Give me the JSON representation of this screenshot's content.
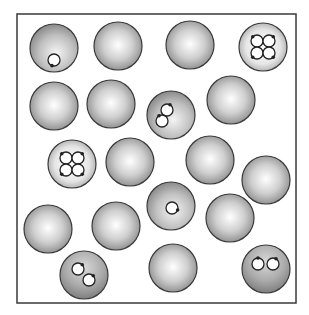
{
  "diagram": {
    "type": "particle-box",
    "frame": {
      "x": 17,
      "y": 14,
      "width": 279,
      "height": 289,
      "stroke": "#3a3a3a"
    },
    "colors": {
      "sphere_highlight": "#ffffff",
      "sphere_mid": "#c4c4c4",
      "sphere_edge": "#8a8a8a",
      "sphere_outline": "#3a3a3a",
      "loop_fill": "#ffffff",
      "loop_stroke": "#222222",
      "dot": "#222222"
    },
    "spheres": [
      {
        "id": 1,
        "cx": 54,
        "cy": 48,
        "r": 24,
        "kind": "one-loop",
        "shade": "medium"
      },
      {
        "id": 2,
        "cx": 118,
        "cy": 46,
        "r": 24,
        "kind": "plain",
        "shade": "normal"
      },
      {
        "id": 3,
        "cx": 190,
        "cy": 45,
        "r": 24,
        "kind": "plain",
        "shade": "normal"
      },
      {
        "id": 4,
        "cx": 263,
        "cy": 47,
        "r": 24,
        "kind": "four-loop",
        "shade": "light"
      },
      {
        "id": 5,
        "cx": 54,
        "cy": 106,
        "r": 24,
        "kind": "plain",
        "shade": "normal"
      },
      {
        "id": 6,
        "cx": 111,
        "cy": 104,
        "r": 24,
        "kind": "plain",
        "shade": "normal"
      },
      {
        "id": 7,
        "cx": 171,
        "cy": 115,
        "r": 24,
        "kind": "two-loop",
        "shade": "medium"
      },
      {
        "id": 8,
        "cx": 231,
        "cy": 100,
        "r": 24,
        "kind": "plain",
        "shade": "normal"
      },
      {
        "id": 9,
        "cx": 72,
        "cy": 164,
        "r": 24,
        "kind": "four-loop",
        "shade": "light"
      },
      {
        "id": 10,
        "cx": 130,
        "cy": 162,
        "r": 24,
        "kind": "plain",
        "shade": "normal"
      },
      {
        "id": 11,
        "cx": 210,
        "cy": 160,
        "r": 24,
        "kind": "plain",
        "shade": "normal"
      },
      {
        "id": 12,
        "cx": 266,
        "cy": 180,
        "r": 24,
        "kind": "plain",
        "shade": "normal"
      },
      {
        "id": 13,
        "cx": 48,
        "cy": 229,
        "r": 24,
        "kind": "plain",
        "shade": "normal"
      },
      {
        "id": 14,
        "cx": 116,
        "cy": 226,
        "r": 24,
        "kind": "plain",
        "shade": "normal"
      },
      {
        "id": 15,
        "cx": 171,
        "cy": 206,
        "r": 24,
        "kind": "one-loop",
        "shade": "medium"
      },
      {
        "id": 16,
        "cx": 230,
        "cy": 218,
        "r": 24,
        "kind": "plain",
        "shade": "normal"
      },
      {
        "id": 17,
        "cx": 84,
        "cy": 275,
        "r": 24,
        "kind": "two-loop",
        "shade": "dark"
      },
      {
        "id": 18,
        "cx": 173,
        "cy": 268,
        "r": 24,
        "kind": "plain",
        "shade": "normal"
      },
      {
        "id": 19,
        "cx": 266,
        "cy": 269,
        "r": 24,
        "kind": "two-loop",
        "shade": "dark"
      }
    ],
    "loops": {
      "one-loop": [
        {
          "dx": 0,
          "dy": 12,
          "r": 6,
          "dot_angle": 110
        }
      ],
      "two-loop": [
        {
          "dx": -4,
          "dy": -5,
          "r": 6,
          "dot_angle": -60
        },
        {
          "dx": -9,
          "dy": 6,
          "r": 6,
          "dot_angle": -120
        }
      ],
      "four-loop": [
        {
          "dx": -6,
          "dy": -6,
          "r": 6,
          "dot_angle": -135
        },
        {
          "dx": 6,
          "dy": -6,
          "r": 6,
          "dot_angle": -45
        },
        {
          "dx": -6,
          "dy": 6,
          "r": 6,
          "dot_angle": 135
        },
        {
          "dx": 6,
          "dy": 6,
          "r": 6,
          "dot_angle": 45
        }
      ]
    },
    "loop_overrides": {
      "15": [
        {
          "dx": 1,
          "dy": 2,
          "r": 6,
          "dot_angle": 20
        }
      ],
      "17": [
        {
          "dx": -6,
          "dy": -6,
          "r": 6,
          "dot_angle": -45
        },
        {
          "dx": 5,
          "dy": 5,
          "r": 6,
          "dot_angle": -45
        }
      ],
      "19": [
        {
          "dx": -8,
          "dy": -5,
          "r": 6,
          "dot_angle": -90
        },
        {
          "dx": 7,
          "dy": -5,
          "r": 6,
          "dot_angle": -60
        }
      ]
    }
  }
}
